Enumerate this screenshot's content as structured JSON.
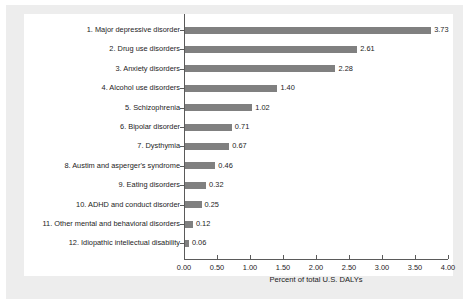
{
  "chart_data": {
    "type": "bar",
    "orientation": "horizontal",
    "title": "",
    "xlabel": "Percent of total U.S. DALYs",
    "ylabel": "",
    "xlim": [
      0.0,
      4.0
    ],
    "xticks": [
      "0.00",
      "0.50",
      "1.00",
      "1.50",
      "2.00",
      "2.50",
      "3.00",
      "3.50",
      "4.00"
    ],
    "xtick_values": [
      0.0,
      0.5,
      1.0,
      1.5,
      2.0,
      2.5,
      3.0,
      3.5,
      4.0
    ],
    "grid": false,
    "legend": null,
    "bar_color": "#808080",
    "axis_color": "#5a5a5a",
    "categories": [
      "1. Major depressive disorder",
      "2. Drug use disorders",
      "3. Anxiety disorders",
      "4. Alcohol use disorders",
      "5. Schizophrenia",
      "6. Bipolar disorder",
      "7. Dysthymia",
      "8. Austim and asperger's syndrome",
      "9. Eating disorders",
      "10. ADHD and conduct disorder",
      "11. Other mental and behavioral disorders",
      "12. Idiopathic intellectual disability"
    ],
    "values": [
      3.73,
      2.61,
      2.28,
      1.4,
      1.02,
      0.71,
      0.67,
      0.46,
      0.32,
      0.25,
      0.12,
      0.06
    ],
    "value_labels": [
      "3.73",
      "2.61",
      "2.28",
      "1.40",
      "1.02",
      "0.71",
      "0.67",
      "0.46",
      "0.32",
      "0.25",
      "0.12",
      "0.06"
    ]
  }
}
